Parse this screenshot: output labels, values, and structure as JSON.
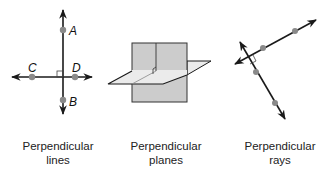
{
  "figures": [
    {
      "id": "lines",
      "caption_line1": "Perpendicular",
      "caption_line2": "lines",
      "points": [
        {
          "label": "A"
        },
        {
          "label": "C"
        },
        {
          "label": "D"
        },
        {
          "label": "B"
        }
      ]
    },
    {
      "id": "planes",
      "caption_line1": "Perpendicular",
      "caption_line2": "planes"
    },
    {
      "id": "rays",
      "caption_line1": "Perpendicular",
      "caption_line2": "rays"
    }
  ],
  "colors": {
    "line": "#1a1a1a",
    "point": "#8a8a8a",
    "vertical_plane": "#cccccc",
    "horizontal_plane": "#ebebeb"
  }
}
